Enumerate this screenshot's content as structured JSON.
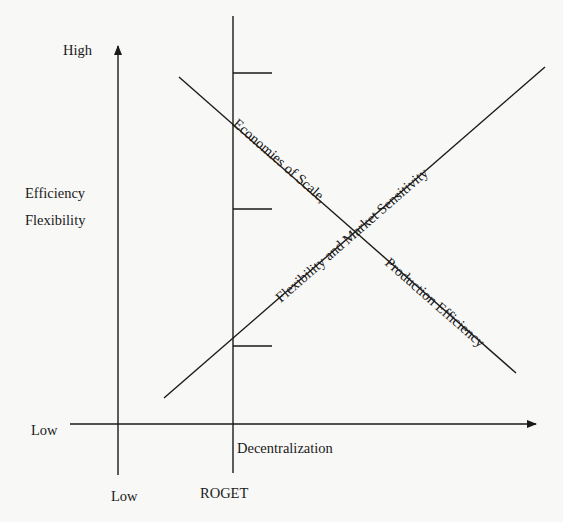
{
  "diagram": {
    "y_axis": {
      "high_label": "High",
      "low_label": "Low",
      "title_lines": [
        "Efficiency",
        "Flexibility"
      ]
    },
    "x_axis": {
      "low_label": "Low",
      "title": "Decentralization"
    },
    "reference_line": {
      "label": "ROGET"
    },
    "curves": {
      "descending_line_label_1": "Economies of Scale,",
      "descending_line_label_2": "Production Efficiency",
      "ascending_line_label": "Flexibility and Market Sensitivity"
    },
    "tick_marks_count": 3,
    "colors": {
      "background": "#f8f8f6",
      "ink": "#1a1a1a"
    }
  }
}
